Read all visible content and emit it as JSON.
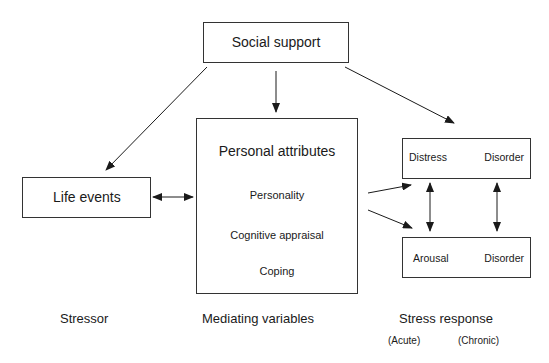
{
  "diagram": {
    "nodes": {
      "social_support": "Social support",
      "life_events": "Life events",
      "personal_attributes": {
        "title": "Personal attributes",
        "items": [
          "Personality",
          "Cognitive appraisal",
          "Coping"
        ]
      },
      "distress_box": {
        "left": "Distress",
        "right": "Disorder"
      },
      "arousal_box": {
        "left": "Arousal",
        "right": "Disorder"
      }
    },
    "column_labels": {
      "stressor": "Stressor",
      "mediating": "Mediating variables",
      "response": "Stress response",
      "acute": "(Acute)",
      "chronic": "(Chronic)"
    },
    "edges": [
      {
        "from": "Social support",
        "to": "Life events",
        "type": "arrow"
      },
      {
        "from": "Social support",
        "to": "Personal attributes",
        "type": "arrow"
      },
      {
        "from": "Social support",
        "to": "Distress/Disorder",
        "type": "arrow"
      },
      {
        "from": "Life events",
        "to": "Personal attributes",
        "type": "bidirectional"
      },
      {
        "from": "Personal attributes",
        "to": "Distress/Disorder",
        "type": "arrow"
      },
      {
        "from": "Personal attributes",
        "to": "Arousal/Disorder",
        "type": "arrow"
      },
      {
        "from": "Distress",
        "to": "Arousal",
        "type": "bidirectional"
      },
      {
        "from": "Disorder (acute row)",
        "to": "Disorder (chronic row)",
        "type": "bidirectional"
      },
      {
        "from": "Personality",
        "to": "Cognitive appraisal",
        "type": "bidirectional"
      },
      {
        "from": "Cognitive appraisal",
        "to": "Coping",
        "type": "bidirectional"
      }
    ]
  }
}
